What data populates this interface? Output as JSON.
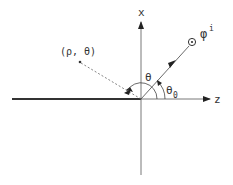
{
  "diagram": {
    "axes": {
      "vertical_label": "x",
      "horizontal_label": "z"
    },
    "source": {
      "symbol": "φ",
      "superscript": "i",
      "marker": "circled-dot"
    },
    "point": {
      "label": "(ρ, θ)"
    },
    "angles": {
      "observation_angle": "θ",
      "incidence_angle": "θ",
      "incidence_subscript": "0"
    },
    "colors": {
      "ink": "#333333",
      "background": "#ffffff"
    }
  }
}
